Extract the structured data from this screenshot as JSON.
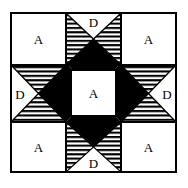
{
  "diagram": {
    "pattern_name": "Ohio Star",
    "background_color": "#ffffff",
    "line_color": "#000000",
    "fill_dark_color": "#000000",
    "fill_light_color": "#ffffff",
    "grid": {
      "rows": 3,
      "cols": 3
    },
    "cells": [
      {
        "id": "top-left",
        "row": 0,
        "col": 0,
        "type": "plain-square",
        "label": "A"
      },
      {
        "id": "top-center",
        "row": 0,
        "col": 1,
        "type": "quarter-square",
        "label": "D"
      },
      {
        "id": "top-right",
        "row": 0,
        "col": 2,
        "type": "plain-square",
        "label": "A"
      },
      {
        "id": "middle-left",
        "row": 1,
        "col": 0,
        "type": "quarter-square",
        "label": "D"
      },
      {
        "id": "center",
        "row": 1,
        "col": 1,
        "type": "plain-square",
        "label": "A"
      },
      {
        "id": "middle-right",
        "row": 1,
        "col": 2,
        "type": "quarter-square",
        "label": "D"
      },
      {
        "id": "bottom-left",
        "row": 2,
        "col": 0,
        "type": "plain-square",
        "label": "A"
      },
      {
        "id": "bottom-center",
        "row": 2,
        "col": 1,
        "type": "quarter-square",
        "label": "D"
      },
      {
        "id": "bottom-right",
        "row": 2,
        "col": 2,
        "type": "plain-square",
        "label": "A"
      }
    ],
    "labels": {
      "top_left": "A",
      "top_center": "D",
      "top_right": "A",
      "middle_left": "D",
      "center": "A",
      "middle_right": "D",
      "bottom_left": "A",
      "bottom_center": "D",
      "bottom_right": "A"
    }
  }
}
